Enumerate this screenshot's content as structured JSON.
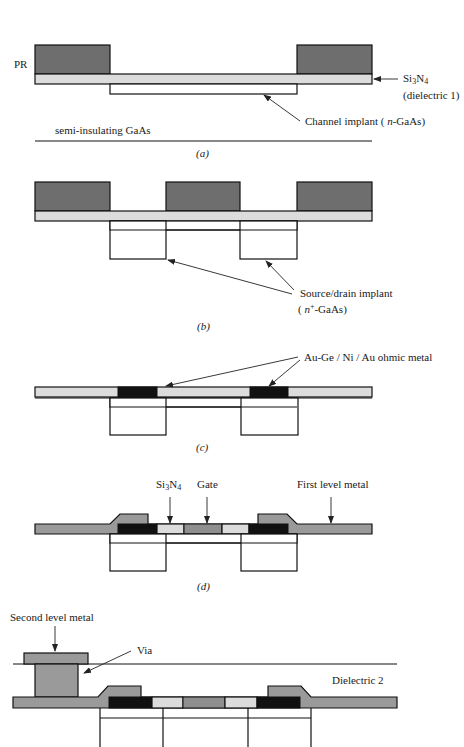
{
  "figure": {
    "colors": {
      "photoresist": "#6e6e6e",
      "nitride": "#dcdcdc",
      "ohmic_metal": "#111111",
      "metal": "#9a9a9a",
      "gate": "#8f8f8f",
      "outline": "#111111"
    },
    "panels": [
      {
        "id": "a",
        "caption": "(a)",
        "labels": {
          "pr": "PR",
          "nitride": "Si3N4",
          "nitride_sub": "(dielectric 1)",
          "channel": "Channel implant (n-GaAs)",
          "substrate": "semi-insulating GaAs"
        }
      },
      {
        "id": "b",
        "caption": "(b)",
        "labels": {
          "source_drain": "Source/drain implant",
          "source_drain_sub": "(n+-GaAs)"
        }
      },
      {
        "id": "c",
        "caption": "(c)",
        "labels": {
          "ohmic": "Au-Ge / Ni / Au ohmic metal"
        }
      },
      {
        "id": "d",
        "caption": "(d)",
        "labels": {
          "nitride": "Si3N4",
          "gate": "Gate",
          "first_metal": "First level metal"
        }
      },
      {
        "id": "e",
        "caption": "",
        "labels": {
          "second_metal": "Second level metal",
          "via": "Via",
          "dielectric2": "Dielectric 2"
        }
      }
    ]
  }
}
